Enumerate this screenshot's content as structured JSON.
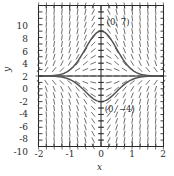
{
  "figure": {
    "name": "slope-field-plot",
    "background_color": "#ffffff",
    "ink_color": "#3a3a3a",
    "curve_color": "#555555",
    "axis_color": "#2b2b2b"
  },
  "axes": {
    "x_label": "x",
    "y_label": "y",
    "x_ticks": [
      "-2",
      "-1",
      "0",
      "1",
      "2"
    ],
    "x_tick_values": [
      -2,
      -1,
      0,
      1,
      2
    ],
    "y_ticks": [
      "10",
      "8",
      "6",
      "4",
      "2",
      "0",
      "-2",
      "-4",
      "-6",
      "-8",
      "-10"
    ],
    "y_tick_values": [
      10,
      8,
      6,
      4,
      2,
      0,
      -2,
      -4,
      -6,
      -8,
      -10
    ],
    "xlim": [
      -2,
      2
    ],
    "ylim": [
      -11,
      11
    ],
    "x_minor_step": 0.25,
    "y_minor_step": 1,
    "frame": true,
    "grid": false
  },
  "annotations": [
    {
      "text": "(0, 7)",
      "x": 0.18,
      "y": 8.4
    },
    {
      "text": "(0, −4)",
      "x": 0.12,
      "y": -5.1
    }
  ],
  "chart_data": {
    "type": "line",
    "title": "",
    "xlabel": "x",
    "ylabel": "y",
    "xlim": [
      -2,
      2
    ],
    "ylim": [
      -11,
      11
    ],
    "grid": false,
    "legend": "none",
    "slope_field": {
      "description": "direction field of dy/dx = -4*x*y, dashes drawn on a grid",
      "nx": 17,
      "ny": 23,
      "x_range": [
        -2,
        2
      ],
      "y_range": [
        -11,
        11
      ],
      "dash_length_px": 6,
      "slope_formula": "-4*x*y"
    },
    "series": [
      {
        "name": "solution-through-0-7",
        "initial_point": [
          0,
          7
        ],
        "formula": "y = 7*exp(-2*x^2)",
        "x": [
          -2,
          -1.75,
          -1.5,
          -1.25,
          -1,
          -0.875,
          -0.75,
          -0.625,
          -0.5,
          -0.375,
          -0.25,
          -0.125,
          0,
          0.125,
          0.25,
          0.375,
          0.5,
          0.625,
          0.75,
          0.875,
          1,
          1.25,
          1.5,
          1.75,
          2
        ],
        "values": [
          0.0,
          0.0015,
          0.0079,
          0.0311,
          0.1281,
          0.3017,
          0.7003,
          1.5175,
          2.8665,
          4.5554,
          6.1799,
          6.7888,
          7.0,
          6.7888,
          6.1799,
          4.5554,
          2.8665,
          1.5175,
          0.7003,
          0.3017,
          0.1281,
          0.0311,
          0.0079,
          0.0015,
          0.0
        ]
      },
      {
        "name": "solution-through-0-minus4",
        "initial_point": [
          0,
          -4
        ],
        "formula": "y = -4*exp(-2*x^2)",
        "x": [
          -2,
          -1.75,
          -1.5,
          -1.25,
          -1,
          -0.875,
          -0.75,
          -0.625,
          -0.5,
          -0.375,
          -0.25,
          -0.125,
          0,
          0.125,
          0.25,
          0.375,
          0.5,
          0.625,
          0.75,
          0.875,
          1,
          1.25,
          1.5,
          1.75,
          2
        ],
        "values": [
          0.0,
          -0.0009,
          -0.0045,
          -0.0178,
          -0.0732,
          -0.1724,
          -0.4002,
          -0.8672,
          -1.638,
          -2.6031,
          -3.5314,
          -3.8793,
          -4.0,
          -3.8793,
          -3.5314,
          -2.6031,
          -1.638,
          -0.8672,
          -0.4002,
          -0.1724,
          -0.0732,
          -0.0178,
          -0.0045,
          -0.0009,
          0.0
        ]
      }
    ]
  }
}
